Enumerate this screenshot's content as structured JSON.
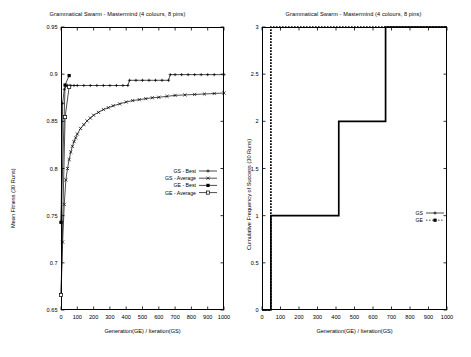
{
  "figure": {
    "background": "#ffffff",
    "ink": "#000000",
    "panel_count": 2
  },
  "chart_data": [
    {
      "id": "left",
      "type": "line",
      "title": "Grammatical Swarm - Mastermind (4 colours, 8 pins)",
      "xlabel": "Generation(GE) / Iteration(GS)",
      "ylabel": "Mean Fitness (30 Runs)",
      "xlim": [
        0,
        1000
      ],
      "ylim": [
        0.65,
        0.95
      ],
      "xticks": [
        0,
        100,
        200,
        300,
        400,
        500,
        600,
        700,
        800,
        900,
        1000
      ],
      "xtick_labels": [
        "0",
        "100",
        "200",
        "300",
        "400",
        "500",
        "600",
        "700",
        "800",
        "900",
        "1000"
      ],
      "yticks": [
        0.65,
        0.7,
        0.75,
        0.8,
        0.85,
        0.9,
        0.95
      ],
      "ytick_labels": [
        "0.65",
        "0.7",
        "0.75",
        "0.8",
        "0.85",
        "0.9",
        "0.95"
      ],
      "grid": false,
      "legend_position": "center-right-inside",
      "series": [
        {
          "name": "GS - Best",
          "marker": "plus",
          "linestyle": "solid",
          "x": [
            0,
            10,
            20,
            30,
            40,
            50,
            60,
            80,
            100,
            140,
            180,
            220,
            260,
            300,
            340,
            380,
            410,
            420,
            460,
            500,
            540,
            580,
            620,
            660,
            670,
            700,
            740,
            780,
            820,
            860,
            900,
            940,
            1000
          ],
          "y": [
            0.7425,
            0.869,
            0.884,
            0.8875,
            0.888,
            0.888,
            0.888,
            0.888,
            0.888,
            0.888,
            0.888,
            0.888,
            0.888,
            0.888,
            0.888,
            0.888,
            0.888,
            0.8935,
            0.8935,
            0.8935,
            0.8935,
            0.8935,
            0.8935,
            0.8935,
            0.8995,
            0.8995,
            0.8995,
            0.8995,
            0.8995,
            0.8995,
            0.8995,
            0.8995,
            0.8995
          ]
        },
        {
          "name": "GS - Average",
          "marker": "cross",
          "linestyle": "solid",
          "x": [
            0,
            10,
            20,
            30,
            40,
            50,
            60,
            70,
            80,
            90,
            100,
            120,
            140,
            160,
            180,
            200,
            230,
            260,
            290,
            320,
            360,
            400,
            440,
            480,
            520,
            560,
            600,
            650,
            700,
            760,
            820,
            880,
            940,
            1000
          ],
          "y": [
            0.666,
            0.722,
            0.762,
            0.788,
            0.8,
            0.8095,
            0.8175,
            0.8235,
            0.8285,
            0.8325,
            0.8365,
            0.8425,
            0.8465,
            0.8505,
            0.8535,
            0.8565,
            0.8595,
            0.8625,
            0.8645,
            0.8665,
            0.8685,
            0.8705,
            0.872,
            0.873,
            0.874,
            0.875,
            0.8755,
            0.8765,
            0.8775,
            0.878,
            0.8785,
            0.879,
            0.8795,
            0.88
          ]
        },
        {
          "name": "GE - Best",
          "marker": "filled-square",
          "linestyle": "solid",
          "x": [
            0,
            25,
            50
          ],
          "y": [
            0.743,
            0.8885,
            0.8985
          ]
        },
        {
          "name": "GE - Average",
          "marker": "open-square",
          "linestyle": "solid",
          "x": [
            0,
            25,
            50
          ],
          "y": [
            0.666,
            0.8545,
            0.8865
          ]
        }
      ]
    },
    {
      "id": "right",
      "type": "line",
      "title": "Grammatical Swarm - Mastermind (4 colours, 8 pins)",
      "xlabel": "Generation(GE) / Iteration(GS)",
      "ylabel": "Cumulative Frequency of Success (30 Runs)",
      "xlim": [
        0,
        1000
      ],
      "ylim": [
        0,
        3
      ],
      "xticks": [
        0,
        100,
        200,
        300,
        400,
        500,
        600,
        700,
        800,
        900,
        1000
      ],
      "xtick_labels": [
        "0",
        "100",
        "200",
        "300",
        "400",
        "500",
        "600",
        "700",
        "800",
        "900",
        "1000"
      ],
      "yticks": [
        0,
        0.5,
        1,
        1.5,
        2,
        2.5,
        3
      ],
      "ytick_labels": [
        "0",
        "0.5",
        "1",
        "1.5",
        "2",
        "2.5",
        "3"
      ],
      "grid": false,
      "legend_position": "center-right-inside",
      "series": [
        {
          "name": "GS",
          "marker": "plus",
          "linestyle": "solid",
          "step": true,
          "x": [
            0,
            48,
            48,
            415,
            415,
            668,
            668,
            1000
          ],
          "y": [
            0,
            0,
            1,
            1,
            2,
            2,
            3,
            3
          ]
        },
        {
          "name": "GE",
          "marker": "filled-square",
          "linestyle": "dashed",
          "step": true,
          "x": [
            0,
            48,
            48,
            48,
            1000
          ],
          "y": [
            0,
            0,
            2,
            3,
            3
          ]
        }
      ]
    }
  ],
  "panels": {
    "left": {
      "legend": [
        {
          "label": "GS - Best",
          "marker": "plus"
        },
        {
          "label": "GS - Average",
          "marker": "cross"
        },
        {
          "label": "GE - Best",
          "marker": "filled-square"
        },
        {
          "label": "GE - Average",
          "marker": "open-square"
        }
      ]
    },
    "right": {
      "legend": [
        {
          "label": "GS",
          "marker": "plus"
        },
        {
          "label": "GE",
          "marker": "filled-square"
        }
      ]
    }
  }
}
